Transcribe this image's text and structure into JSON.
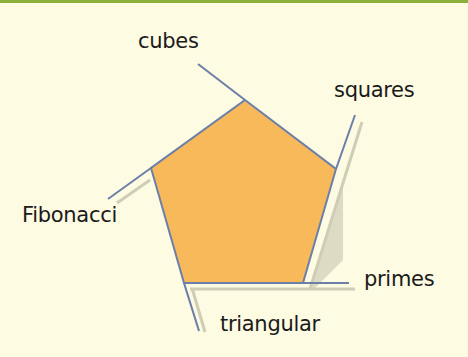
{
  "diagram": {
    "type": "pentagon",
    "colors": {
      "background": "#fdfbe2",
      "top_band": "#8cb03a",
      "fill": "#f7b95a",
      "edge": "#6b7fa8",
      "shadow": "#c9c8b4"
    },
    "labels": {
      "cubes": "cubes",
      "squares": "squares",
      "fibonacci": "Fibonacci",
      "primes": "primes",
      "triangular": "triangular"
    }
  }
}
